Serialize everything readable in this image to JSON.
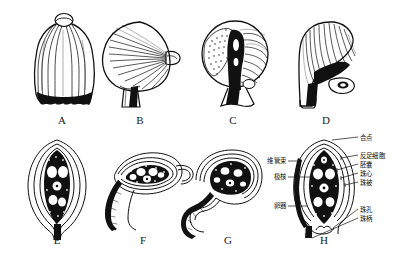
{
  "figure": {
    "background_color": "#ffffff",
    "ink_color": "#111111",
    "panels": [
      {
        "id": "A",
        "letter": "A",
        "name": "orthotropous-ovule-external",
        "row": "top"
      },
      {
        "id": "B",
        "letter": "B",
        "name": "anatropous-ovule-external",
        "row": "top"
      },
      {
        "id": "C",
        "letter": "C",
        "name": "amphitropous-ovule-external",
        "row": "top"
      },
      {
        "id": "D",
        "letter": "D",
        "name": "campylotropous-ovule-external",
        "row": "top"
      },
      {
        "id": "E",
        "letter": "E",
        "name": "orthotropous-ovule-section",
        "row": "bottom"
      },
      {
        "id": "F",
        "letter": "F",
        "name": "anatropous-ovule-section",
        "row": "bottom"
      },
      {
        "id": "G",
        "letter": "G",
        "name": "campylotropous-ovule-section",
        "row": "bottom"
      },
      {
        "id": "H",
        "letter": "H",
        "name": "labelled-ovule-section",
        "row": "bottom"
      }
    ]
  },
  "labels": {
    "right": [
      {
        "id": "chalaza",
        "text": "合点"
      },
      {
        "id": "antipodal-cells",
        "text": "反足细胞"
      },
      {
        "id": "embryo-sac",
        "text": "胚囊"
      },
      {
        "id": "nucellus",
        "text": "珠心"
      },
      {
        "id": "integument",
        "text": "珠被"
      },
      {
        "id": "micropyle",
        "text": "珠孔"
      },
      {
        "id": "funiculus",
        "text": "珠柄"
      }
    ],
    "left": [
      {
        "id": "vascular-bundle",
        "text": "维管束"
      },
      {
        "id": "polar-nuclei",
        "text": "极核"
      },
      {
        "id": "egg-apparatus",
        "text": "卵器"
      }
    ]
  }
}
